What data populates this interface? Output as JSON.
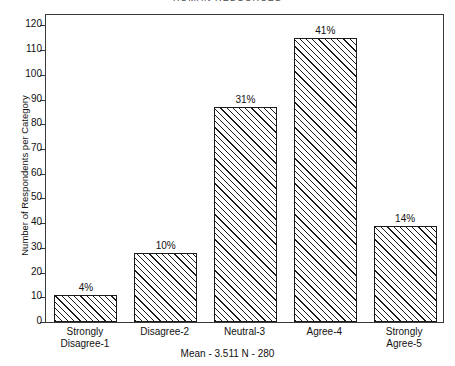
{
  "chart_data": {
    "type": "bar",
    "title": "HUMAN RESOURCES",
    "xlabel": "",
    "ylabel": "Number of Respondents per Category",
    "categories": [
      "Strongly\nDisagree-1",
      "Disagree-2",
      "Neutral-3",
      "Agree-4",
      "Strongly\nAgree-5"
    ],
    "category_lines": [
      [
        "Strongly",
        "Disagree-1"
      ],
      [
        "Disagree-2",
        ""
      ],
      [
        "Neutral-3",
        ""
      ],
      [
        "Agree-4",
        ""
      ],
      [
        "Strongly",
        "Agree-5"
      ]
    ],
    "values": [
      11,
      28,
      87,
      115,
      39
    ],
    "data_labels": [
      "4%",
      "10%",
      "31%",
      "41%",
      "14%"
    ],
    "percentages": [
      4,
      10,
      31,
      41,
      14
    ],
    "ylim": [
      0,
      125
    ],
    "yticks": [
      0,
      10,
      20,
      30,
      40,
      50,
      60,
      70,
      80,
      90,
      100,
      110,
      120
    ],
    "ytick_labels": [
      "0",
      "10",
      "20",
      "30",
      "40",
      "50",
      "60",
      "70",
      "80",
      "90",
      "100",
      "110",
      "120"
    ],
    "grid": false,
    "legend": false,
    "footnote": "Mean - 3.511  N - 280",
    "bar_fill": "hatched-diagonal",
    "bar_edge_color": "#1b1b1b",
    "background_color": "#ffffff"
  },
  "footer": {
    "mean_label": "Mean - 3.511  N - 280"
  }
}
